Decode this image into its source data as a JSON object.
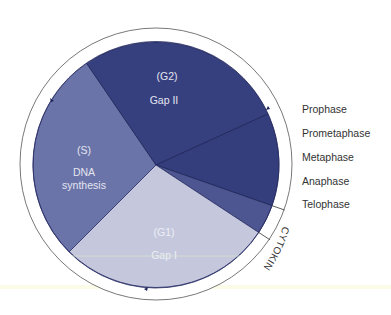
{
  "diagram": {
    "center": [
      156,
      165
    ],
    "pie_radius": 123,
    "ring_radius": 136,
    "colors": {
      "s": "#6b74a8",
      "g2": "#37407f",
      "mitosis": "#353e7d",
      "telophase": "#4d5690",
      "g1": "#c5c8dc",
      "inner_text_light": "#e3e5f0",
      "inner_text_g1": "#eceef6",
      "edge": "#1e2458"
    },
    "sectors": [
      {
        "id": "g2",
        "label_top": "(G2)",
        "label_bottom": "Gap II"
      },
      {
        "id": "mitosis",
        "label_top": "",
        "label_bottom": ""
      },
      {
        "id": "telophase",
        "label_top": "",
        "label_bottom": ""
      },
      {
        "id": "g1",
        "label_top": "(G1)",
        "label_bottom": "Gap I"
      },
      {
        "id": "s",
        "label_top": "(S)",
        "label_bottom": "DNA",
        "label_extra": "synthesis"
      }
    ],
    "mitosis_phases": [
      "Prophase",
      "Prometaphase",
      "Metaphase",
      "Anaphase",
      "Telophase"
    ],
    "cytokinesis_label": "CYTOKINESIS"
  }
}
